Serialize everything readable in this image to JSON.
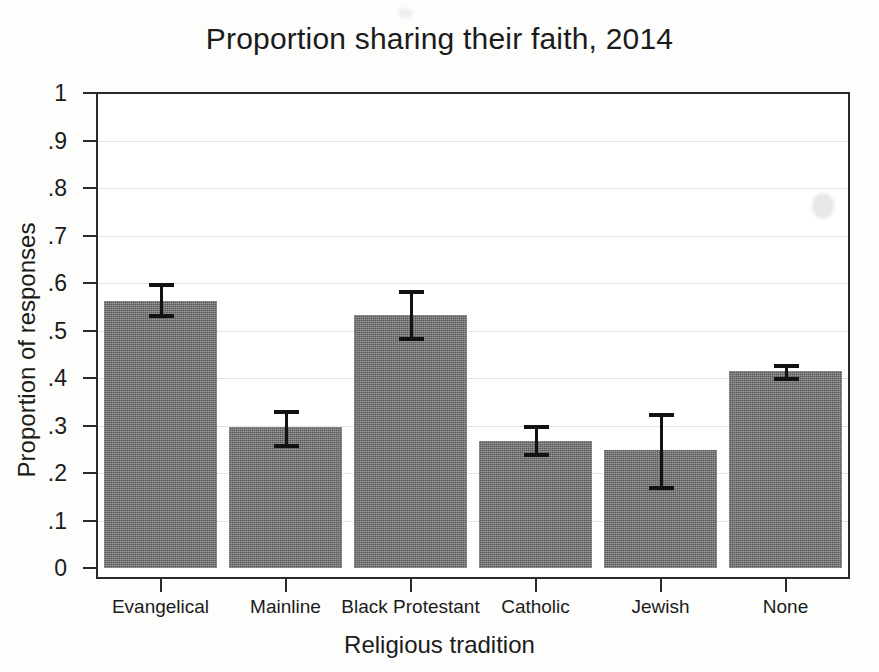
{
  "chart_data": {
    "type": "bar",
    "title": "Proportion sharing their faith, 2014",
    "xlabel": "Religious tradition",
    "ylabel": "Proportion of responses",
    "categories": [
      "Evangelical",
      "Mainline",
      "Black Protestant",
      "Catholic",
      "Jewish",
      "None"
    ],
    "values": [
      0.563,
      0.296,
      0.532,
      0.268,
      0.249,
      0.414
    ],
    "error_low": [
      0.527,
      0.253,
      0.477,
      0.234,
      0.164,
      0.394
    ],
    "error_high": [
      0.601,
      0.332,
      0.585,
      0.301,
      0.327,
      0.43
    ],
    "ylim": [
      0,
      1
    ],
    "ytick_labels": [
      "0",
      ".1",
      ".2",
      ".3",
      ".4",
      ".5",
      ".6",
      ".7",
      ".8",
      ".9",
      "1"
    ],
    "ytick_values": [
      0,
      0.1,
      0.2,
      0.3,
      0.4,
      0.5,
      0.6,
      0.7,
      0.8,
      0.9,
      1
    ],
    "grid": true,
    "grid_axis": "y",
    "legend": null,
    "bar_color": "#6e6e6e",
    "error_color": "#121212",
    "grid_color": "#e3e3e3",
    "axis_color": "#2a2a2a",
    "background": "#ffffff"
  }
}
